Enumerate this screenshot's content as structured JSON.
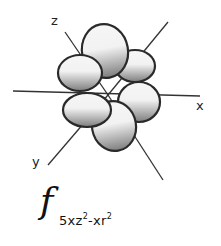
{
  "diagram": {
    "axes": {
      "x": "x",
      "y": "y",
      "z": "z"
    },
    "formula": {
      "symbol": "f",
      "subscript_parts": [
        "5xz",
        "2",
        "-xr",
        "2"
      ]
    },
    "lobe_count": 6,
    "colors": {
      "lobe_light": "#f4f4f4",
      "lobe_dark": "#8a8a8a",
      "outline": "#2a2a2a",
      "axis": "#333333"
    }
  }
}
